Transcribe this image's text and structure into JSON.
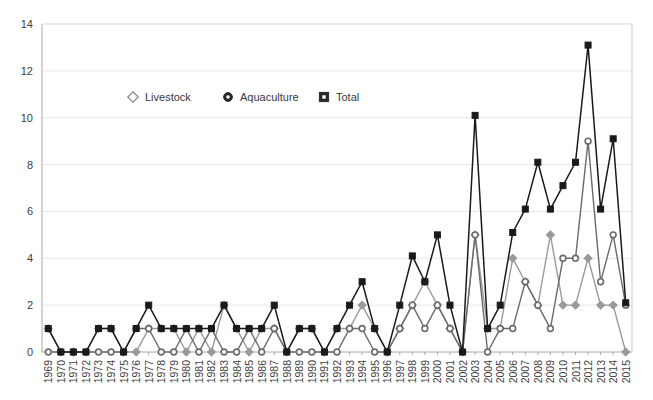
{
  "chart_data": {
    "type": "line",
    "title": "",
    "subtitle": "",
    "xlabel": "",
    "ylabel": "",
    "ylim": [
      0,
      14
    ],
    "yticks": [
      0,
      2,
      4,
      6,
      8,
      10,
      12,
      14
    ],
    "grid": true,
    "grid_axis": "y",
    "legend_position": "top-center-inside",
    "categories": [
      "1969",
      "1970",
      "1971",
      "1972",
      "1973",
      "1974",
      "1975",
      "1976",
      "1977",
      "1978",
      "1979",
      "1980",
      "1981",
      "1982",
      "1983",
      "1984",
      "1985",
      "1986",
      "1987",
      "1988",
      "1989",
      "1990",
      "1991",
      "1992",
      "1993",
      "1994",
      "1995",
      "1996",
      "1997",
      "1998",
      "1999",
      "2000",
      "2001",
      "2002",
      "2003",
      "2004",
      "2005",
      "2006",
      "2007",
      "2008",
      "2009",
      "2010",
      "2011",
      "2012",
      "2013",
      "2014",
      "2015"
    ],
    "series": [
      {
        "name": "Livestock",
        "marker": "diamond",
        "color": "#9a9a9a",
        "values": [
          1,
          0,
          0,
          0,
          1,
          1,
          0,
          0,
          1,
          1,
          1,
          0,
          1,
          0,
          2,
          1,
          0,
          1,
          1,
          0,
          1,
          1,
          0,
          1,
          1,
          2,
          1,
          0,
          1,
          2,
          3,
          2,
          1,
          0,
          5,
          1,
          1,
          4,
          3,
          2,
          5,
          2,
          2,
          4,
          2,
          2,
          0
        ]
      },
      {
        "name": "Aquaculture",
        "marker": "circle",
        "color": "#6b6b6b",
        "values": [
          0,
          0,
          0,
          0,
          0,
          0,
          0,
          1,
          1,
          0,
          0,
          1,
          0,
          1,
          0,
          0,
          1,
          0,
          1,
          0,
          0,
          0,
          0,
          0,
          1,
          1,
          0,
          0,
          1,
          2,
          1,
          2,
          1,
          0,
          5,
          0,
          1,
          1,
          3,
          2,
          1,
          4,
          4,
          9,
          3,
          5,
          2
        ]
      },
      {
        "name": "Total",
        "marker": "square",
        "color": "#1a1a1a",
        "values": [
          1,
          0,
          0,
          0,
          1,
          1,
          0,
          1,
          2,
          1,
          1,
          1,
          1,
          1,
          2,
          1,
          1,
          1,
          2,
          0,
          1,
          1,
          0,
          1,
          2,
          3,
          1,
          0,
          2,
          4.1,
          3,
          5,
          2,
          0,
          10.1,
          1,
          2,
          5.1,
          6.1,
          8.1,
          6.1,
          7.1,
          8.1,
          13.1,
          6.1,
          9.1,
          2.1
        ]
      }
    ]
  },
  "legend": {
    "items": [
      {
        "label": "Livestock",
        "marker": "diamond-marker-icon"
      },
      {
        "label": "Aquaculture",
        "marker": "circle-marker-icon"
      },
      {
        "label": "Total",
        "marker": "square-marker-icon"
      }
    ]
  },
  "colors": {
    "livestock": "#9a9a9a",
    "aquaculture": "#6b6b6b",
    "total": "#1a1a1a",
    "axis": "#a8a8a8",
    "grid": "#e8e8e8",
    "text": "#404040",
    "background": "#ffffff"
  }
}
